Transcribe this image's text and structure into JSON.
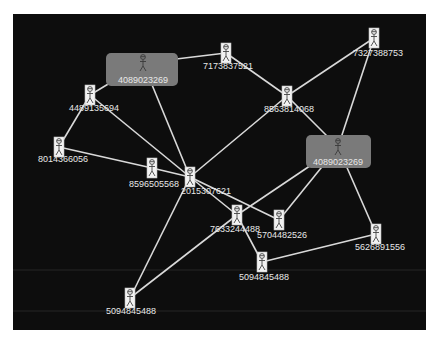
{
  "diagram": {
    "type": "network-graph",
    "background": "#0d0d0d",
    "edge_color": "#d9d9d9",
    "hub_box_color": "#7a7a7a",
    "label_color": "#e8e8e8",
    "node_icon": "person-icon",
    "nodes": [
      {
        "id": "hub1",
        "label": "4089023269",
        "x": 143,
        "y": 63,
        "hub": true,
        "box": [
          106,
          53,
          72,
          33
        ],
        "lx": 143,
        "ly": 83
      },
      {
        "id": "hub2",
        "label": "4089023269",
        "x": 338,
        "y": 147,
        "hub": true,
        "box": [
          306,
          135,
          65,
          33
        ],
        "lx": 338,
        "ly": 165
      },
      {
        "id": "n7173837521",
        "label": "7173837521",
        "x": 226,
        "y": 53,
        "lx": 228,
        "ly": 69
      },
      {
        "id": "n7327388753",
        "label": "7327388753",
        "x": 374,
        "y": 38,
        "lx": 378,
        "ly": 56
      },
      {
        "id": "n4489135694",
        "label": "4489135694",
        "x": 90,
        "y": 95,
        "lx": 94,
        "ly": 111
      },
      {
        "id": "n8563814068",
        "label": "8563814068",
        "x": 287,
        "y": 96,
        "lx": 289,
        "ly": 112
      },
      {
        "id": "n8014366056",
        "label": "8014366056",
        "x": 59,
        "y": 147,
        "lx": 63,
        "ly": 162
      },
      {
        "id": "n8596505568",
        "label": "8596505568",
        "x": 152,
        "y": 168,
        "lx": 154,
        "ly": 187
      },
      {
        "id": "n2015307621",
        "label": "2015307621",
        "x": 190,
        "y": 177,
        "lx": 206,
        "ly": 194
      },
      {
        "id": "n7633244488",
        "label": "7633244488",
        "x": 237,
        "y": 215,
        "lx": 235,
        "ly": 232
      },
      {
        "id": "n5704482526",
        "label": "5704482526",
        "x": 279,
        "y": 220,
        "lx": 282,
        "ly": 238
      },
      {
        "id": "n5626891556",
        "label": "5626891556",
        "x": 376,
        "y": 234,
        "lx": 380,
        "ly": 250
      },
      {
        "id": "n5094845488a",
        "label": "5094845488",
        "x": 262,
        "y": 262,
        "lx": 264,
        "ly": 280
      },
      {
        "id": "n5094845488b",
        "label": "5094845488",
        "x": 130,
        "y": 298,
        "lx": 131,
        "ly": 314
      }
    ],
    "edges": [
      [
        "hub1",
        "n7173837521"
      ],
      [
        "hub1",
        "n4489135694"
      ],
      [
        "hub1",
        "n2015307621"
      ],
      [
        "n4489135694",
        "n8014366056"
      ],
      [
        "n4489135694",
        "n2015307621"
      ],
      [
        "n8014366056",
        "n8596505568"
      ],
      [
        "n8596505568",
        "n2015307621"
      ],
      [
        "n7173837521",
        "n8563814068"
      ],
      [
        "n8563814068",
        "n7327388753"
      ],
      [
        "n8563814068",
        "hub2"
      ],
      [
        "n8563814068",
        "n2015307621"
      ],
      [
        "n7327388753",
        "hub2"
      ],
      [
        "hub2",
        "n5704482526"
      ],
      [
        "hub2",
        "n5626891556"
      ],
      [
        "hub2",
        "n7633244488"
      ],
      [
        "n7633244488",
        "n5094845488b"
      ],
      [
        "n2015307621",
        "n5094845488b"
      ],
      [
        "n2015307621",
        "n7633244488"
      ],
      [
        "n7633244488",
        "n5094845488a"
      ],
      [
        "n2015307621",
        "n5704482526"
      ],
      [
        "n5094845488a",
        "n5626891556"
      ]
    ]
  }
}
